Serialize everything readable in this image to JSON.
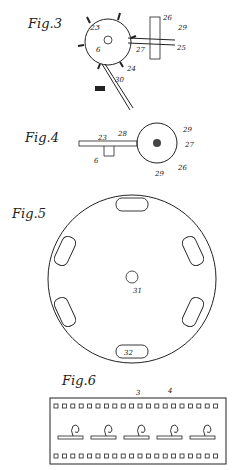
{
  "figures": [
    {
      "id": "fig3",
      "title": "Fig.3",
      "labels": [
        "23",
        "26",
        "29",
        "6",
        "27",
        "25",
        "24",
        "30"
      ]
    },
    {
      "id": "fig4",
      "title": "Fig.4",
      "labels": [
        "23",
        "28",
        "29",
        "27",
        "6",
        "26",
        "29"
      ]
    },
    {
      "id": "fig5",
      "title": "Fig.5",
      "labels": [
        "31",
        "32"
      ]
    },
    {
      "id": "fig6",
      "title": "Fig.6",
      "labels": [
        "3",
        "4",
        "4"
      ],
      "frames": 5,
      "sprocket_holes_per_row": 20
    }
  ]
}
